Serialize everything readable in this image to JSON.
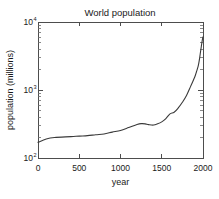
{
  "chart_data": {
    "type": "line",
    "title": "World population",
    "xlabel": "year",
    "ylabel": "population (millions)",
    "xscale": "linear",
    "yscale": "log",
    "xlim": [
      0,
      2000
    ],
    "ylim": [
      100,
      10000
    ],
    "grid": false,
    "legend": null,
    "xticks": [
      0,
      500,
      1000,
      1500,
      2000
    ],
    "xticklabels": [
      "0",
      "500",
      "1000",
      "1500",
      "2000"
    ],
    "yticks": [
      100,
      1000,
      10000
    ],
    "yticklabels": [
      "10",
      "10",
      "10"
    ],
    "yticklabel_exponents": [
      "2",
      "3",
      "4"
    ],
    "series": [
      {
        "name": "world population",
        "x": [
          0,
          100,
          200,
          400,
          500,
          600,
          700,
          800,
          900,
          1000,
          1100,
          1200,
          1250,
          1300,
          1340,
          1400,
          1450,
          1500,
          1550,
          1600,
          1650,
          1700,
          1750,
          1800,
          1850,
          1900,
          1920,
          1940,
          1950,
          1960,
          1970,
          1980,
          1990,
          2000
        ],
        "y": [
          170,
          190,
          200,
          206,
          210,
          213,
          220,
          226,
          240,
          254,
          280,
          310,
          320,
          318,
          310,
          305,
          318,
          340,
          380,
          445,
          470,
          545,
          660,
          830,
          1130,
          1550,
          1840,
          2200,
          2520,
          3000,
          3650,
          4400,
          5280,
          6070
        ]
      }
    ]
  },
  "axes": {
    "title_text": "World population",
    "x_axis_title": "year",
    "y_axis_title": "population (millions)",
    "y_tick_mantissa": "10",
    "y_exp_top": "4",
    "y_exp_mid": "3",
    "y_exp_bottom": "2"
  },
  "colors": {
    "background": "#ffffff",
    "axis": "#4d4d4d",
    "curve": "#3a3a3a",
    "text": "#1a1a1a"
  }
}
